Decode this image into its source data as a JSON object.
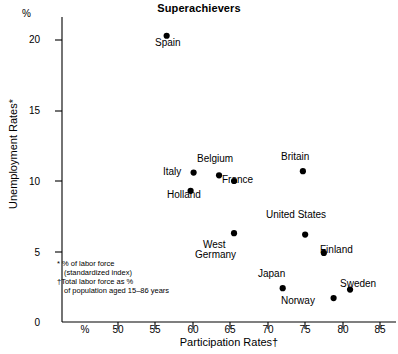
{
  "chart_data": {
    "type": "scatter",
    "title": "Superachievers",
    "xlabel": "Participation Rates†",
    "ylabel": "Unemployment Rates*",
    "x_unit_label": "%",
    "y_unit_label": "%",
    "xlim": [
      46,
      88
    ],
    "ylim": [
      0,
      21.6
    ],
    "grid": false,
    "legend": "none",
    "xticks": [
      50,
      55,
      60,
      65,
      70,
      75,
      80,
      85
    ],
    "xtick_labels": [
      "50",
      "55",
      "60",
      "65",
      "70",
      "75",
      "80",
      "85"
    ],
    "yticks": [
      0,
      5,
      10,
      15,
      20
    ],
    "ytick_labels": [
      "0",
      "5",
      "10",
      "15",
      "20"
    ],
    "points": [
      {
        "name": "Spain",
        "x": 56.5,
        "y": 20.3,
        "label": "Spain",
        "label_pos": "below"
      },
      {
        "name": "Italy",
        "x": 60.1,
        "y": 10.6,
        "label": "Italy",
        "label_pos": "left"
      },
      {
        "name": "Belgium",
        "x": 63.5,
        "y": 10.4,
        "label": "Belgium",
        "label_pos": "above"
      },
      {
        "name": "France",
        "x": 65.5,
        "y": 10.0,
        "label": "France",
        "label_pos": "right"
      },
      {
        "name": "Britain",
        "x": 74.7,
        "y": 10.7,
        "label": "Britain",
        "label_pos": "above"
      },
      {
        "name": "Holland",
        "x": 59.7,
        "y": 9.3,
        "label": "Holland",
        "label_pos": "below"
      },
      {
        "name": "United States",
        "x": 75.0,
        "y": 6.2,
        "label": "United States",
        "label_pos": "above"
      },
      {
        "name": "West Germany",
        "x": 65.5,
        "y": 6.3,
        "label": "West\nGermany",
        "label_pos": "below"
      },
      {
        "name": "Finland",
        "x": 77.5,
        "y": 4.9,
        "label": "Finland",
        "label_pos": "right"
      },
      {
        "name": "Japan",
        "x": 72.0,
        "y": 2.4,
        "label": "Japan",
        "label_pos": "above"
      },
      {
        "name": "Sweden",
        "x": 81.0,
        "y": 2.3,
        "label": "Sweden",
        "label_pos": "right"
      },
      {
        "name": "Norway",
        "x": 78.8,
        "y": 1.7,
        "label": "Norway",
        "label_pos": "left"
      }
    ],
    "annotations": [
      "* % of labor force",
      "(standardized index)",
      "†Total labor force as %",
      "of population aged 15–86 years"
    ],
    "marker_color": "#000000",
    "axis_color": "#000000"
  },
  "footnotes": {
    "line1": "* % of labor force",
    "line2": "(standardized index)",
    "line3": "†Total labor force as %",
    "line4": "of population aged 15–86 years"
  },
  "labels": {
    "spain": "Spain",
    "italy": "Italy",
    "belgium": "Belgium",
    "france": "France",
    "britain": "Britain",
    "holland": "Holland",
    "united_states": "United States",
    "west": "West",
    "germany": "Germany",
    "finland": "Finland",
    "japan": "Japan",
    "sweden": "Sweden",
    "norway": "Norway"
  },
  "axis": {
    "y_unit": "%",
    "x_unit": "%",
    "y_tick_20": "20",
    "y_tick_15": "15",
    "y_tick_10": "10",
    "y_tick_5": "5",
    "y_tick_0": "0",
    "x_tick_50": "50",
    "x_tick_55": "55",
    "x_tick_60": "60",
    "x_tick_65": "65",
    "x_tick_70": "70",
    "x_tick_75": "75",
    "x_tick_80": "80",
    "x_tick_85": "85"
  }
}
